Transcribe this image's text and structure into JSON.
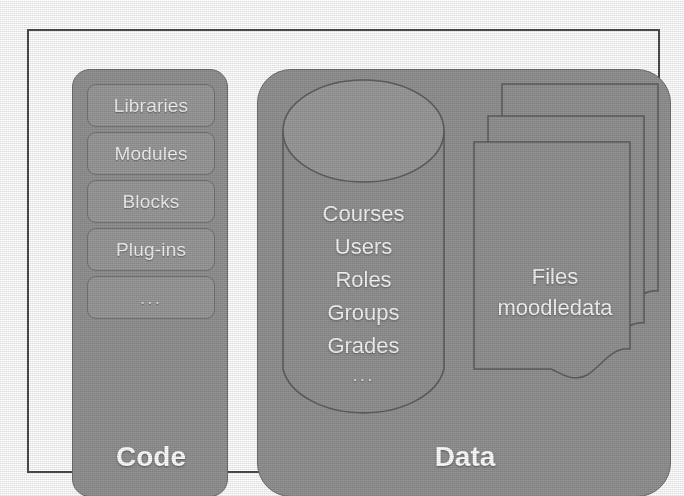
{
  "figure": {
    "colors": {
      "panel_fill": "#939393",
      "panel_stroke": "#6f6f6f",
      "item_fill": "#9a9a9a",
      "item_stroke": "#737373",
      "frame_stroke": "#4b4b4b",
      "label_text": "#ffffff",
      "background": "#ffffff"
    }
  },
  "code_panel": {
    "title": "Code",
    "items": [
      {
        "label": "Libraries"
      },
      {
        "label": "Modules"
      },
      {
        "label": "Blocks"
      },
      {
        "label": "Plug-ins"
      },
      {
        "label": "..."
      }
    ]
  },
  "data_panel": {
    "title": "Data",
    "database": {
      "shape": "cylinder",
      "entries": [
        {
          "label": "Courses"
        },
        {
          "label": "Users"
        },
        {
          "label": "Roles"
        },
        {
          "label": "Groups"
        },
        {
          "label": "Grades"
        },
        {
          "label": "..."
        }
      ]
    },
    "file_store": {
      "shape": "document-stack",
      "sheet_count": 3,
      "lines": [
        {
          "label": "Files"
        },
        {
          "label": "moodledata"
        }
      ]
    }
  }
}
